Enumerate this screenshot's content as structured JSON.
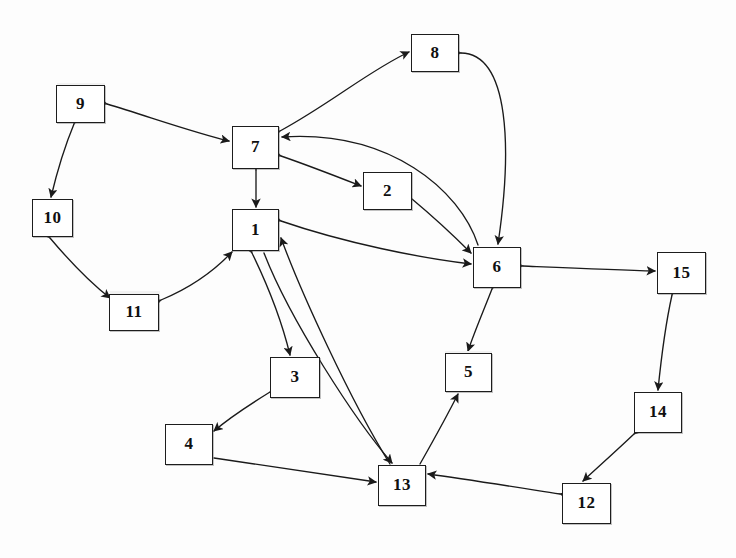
{
  "diagram": {
    "width": 736,
    "height": 558,
    "node_fill": "#ffffff",
    "node_stroke": "#1d1d1d",
    "edge_color": "#1a1a1a",
    "nodes": [
      {
        "id": "1",
        "label": "1",
        "x": 232,
        "y": 209,
        "w": 47,
        "h": 42
      },
      {
        "id": "2",
        "label": "2",
        "x": 363,
        "y": 172,
        "w": 49,
        "h": 38
      },
      {
        "id": "3",
        "label": "3",
        "x": 270,
        "y": 357,
        "w": 50,
        "h": 41
      },
      {
        "id": "4",
        "label": "4",
        "x": 165,
        "y": 424,
        "w": 48,
        "h": 41
      },
      {
        "id": "5",
        "label": "5",
        "x": 445,
        "y": 353,
        "w": 47,
        "h": 39
      },
      {
        "id": "6",
        "label": "6",
        "x": 473,
        "y": 247,
        "w": 48,
        "h": 41
      },
      {
        "id": "7",
        "label": "7",
        "x": 232,
        "y": 126,
        "w": 47,
        "h": 43
      },
      {
        "id": "8",
        "label": "8",
        "x": 411,
        "y": 34,
        "w": 48,
        "h": 38
      },
      {
        "id": "9",
        "label": "9",
        "x": 56,
        "y": 85,
        "w": 49,
        "h": 38
      },
      {
        "id": "10",
        "label": "10",
        "x": 32,
        "y": 199,
        "w": 41,
        "h": 38
      },
      {
        "id": "11",
        "label": "11",
        "x": 109,
        "y": 294,
        "w": 50,
        "h": 37
      },
      {
        "id": "12",
        "label": "12",
        "x": 562,
        "y": 483,
        "w": 49,
        "h": 41
      },
      {
        "id": "13",
        "label": "13",
        "x": 378,
        "y": 465,
        "w": 48,
        "h": 41
      },
      {
        "id": "14",
        "label": "14",
        "x": 634,
        "y": 392,
        "w": 48,
        "h": 41
      },
      {
        "id": "15",
        "label": "15",
        "x": 657,
        "y": 252,
        "w": 49,
        "h": 42
      }
    ],
    "edges": [
      {
        "from": "7",
        "to": "8",
        "arrows": "both",
        "path": "M 280 131 C 330 104 370 70 409 52"
      },
      {
        "from": "8",
        "to": "6",
        "arrows": "both",
        "path": "M 461 53 C 510 54 512 150 498 244"
      },
      {
        "from": "9",
        "to": "7",
        "arrows": "both",
        "path": "M 107 104 C 150 117 195 133 229 141"
      },
      {
        "from": "9",
        "to": "10",
        "arrows": "both",
        "path": "M 74 124 C 64 148 57 172 51 197"
      },
      {
        "from": "10",
        "to": "11",
        "arrows": "both",
        "path": "M 50 238 C 72 264 92 284 110 298"
      },
      {
        "from": "11",
        "to": "1",
        "arrows": "both",
        "path": "M 161 300 C 190 288 215 270 232 252"
      },
      {
        "from": "7",
        "to": "1",
        "arrows": "both",
        "path": "M 256 170 L 256 207"
      },
      {
        "from": "7",
        "to": "2",
        "arrows": "both",
        "path": "M 281 156 C 310 166 338 177 361 186"
      },
      {
        "from": "6",
        "to": "7",
        "arrows": "one",
        "path": "M 478 245 C 460 190 390 130 282 137"
      },
      {
        "from": "2",
        "to": "6",
        "arrows": "one",
        "path": "M 412 199 C 436 219 456 238 471 253"
      },
      {
        "from": "1",
        "to": "6",
        "arrows": "both",
        "path": "M 281 221 C 345 243 420 258 471 264"
      },
      {
        "from": "6",
        "to": "15",
        "arrows": "both",
        "path": "M 523 266 C 570 268 615 270 655 271"
      },
      {
        "from": "6",
        "to": "5",
        "arrows": "both",
        "path": "M 492 289 C 483 312 474 333 468 351"
      },
      {
        "from": "15",
        "to": "14",
        "arrows": "both",
        "path": "M 672 295 C 666 322 661 360 658 390"
      },
      {
        "from": "14",
        "to": "12",
        "arrows": "both",
        "path": "M 634 434 C 615 452 597 468 583 481"
      },
      {
        "from": "12",
        "to": "13",
        "arrows": "both",
        "path": "M 560 494 C 515 487 465 479 428 474"
      },
      {
        "from": "13",
        "to": "5",
        "arrows": "one",
        "path": "M 420 464 C 437 434 450 410 458 394"
      },
      {
        "from": "1",
        "to": "13",
        "arrows": "one",
        "path": "M 264 253 C 290 320 355 420 392 463"
      },
      {
        "from": "1",
        "to": "3",
        "arrows": "both",
        "path": "M 252 253 C 270 290 283 326 290 355"
      },
      {
        "from": "3",
        "to": "4",
        "arrows": "both",
        "path": "M 270 392 C 249 405 228 419 214 431"
      },
      {
        "from": "4",
        "to": "13",
        "arrows": "one",
        "path": "M 214 458 C 280 468 340 477 376 482"
      },
      {
        "from": "13",
        "to": "1",
        "arrows": "one",
        "path": "M 390 464 C 350 400 300 290 281 238"
      }
    ]
  }
}
